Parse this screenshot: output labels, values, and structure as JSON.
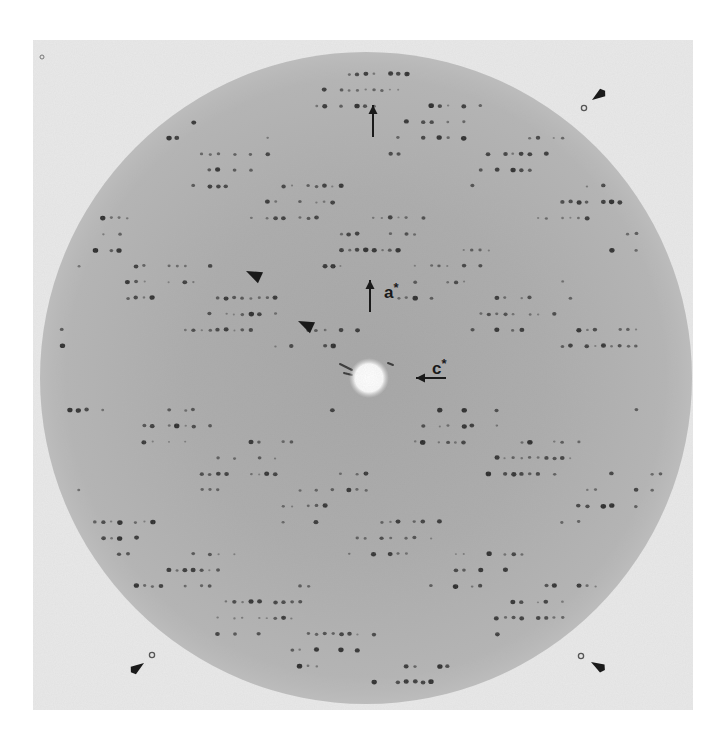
{
  "figure": {
    "panel": {
      "x": 33,
      "y": 40,
      "width": 660,
      "height": 670,
      "background": "#e9e9e9"
    },
    "film_disc": {
      "cx": 366,
      "cy": 378,
      "r": 326,
      "color_center": "#a9a9a9",
      "color_edge": "#b9b9b9"
    },
    "beamstop": {
      "cx": 369,
      "cy": 378,
      "r": 16,
      "color": "#ffffff"
    },
    "spot_color": "#1e1e1e",
    "lattice": {
      "row_spacing": 16,
      "spot_spacing": 8.2,
      "center_y": 378
    }
  },
  "labels": {
    "a_star": {
      "text": "a",
      "sup": "*",
      "x": 384,
      "y": 284
    },
    "c_star": {
      "text": "c",
      "sup": "*",
      "x": 432,
      "y": 360
    }
  },
  "arrows": [
    {
      "name": "a-star-axis-arrow",
      "x1": 370,
      "y1": 312,
      "x2": 370,
      "y2": 280
    },
    {
      "name": "c-star-axis-arrow",
      "x1": 446,
      "y1": 378,
      "x2": 416,
      "y2": 378
    },
    {
      "name": "top-edge-arrow",
      "x1": 373,
      "y1": 137,
      "x2": 373,
      "y2": 105
    }
  ],
  "arrowheads": [
    {
      "name": "upper-left-arrowhead",
      "tip": [
        246,
        271
      ],
      "angle": 205
    },
    {
      "name": "middle-arrowhead",
      "tip": [
        298,
        321
      ],
      "angle": 205
    }
  ],
  "corner_markers": [
    {
      "name": "fiducial-top-right",
      "dot": [
        584,
        108
      ],
      "arrow_tip": [
        592,
        100
      ],
      "angle": -35
    },
    {
      "name": "fiducial-bottom-left",
      "dot": [
        152,
        655
      ],
      "arrow_tip": [
        144,
        663
      ],
      "angle": 145
    },
    {
      "name": "fiducial-bottom-right",
      "dot": [
        581,
        656
      ],
      "arrow_tip": [
        591,
        662
      ],
      "angle": 30
    }
  ],
  "small_dots": [
    {
      "name": "corner-dot-top-left",
      "x": 42,
      "y": 57
    }
  ]
}
